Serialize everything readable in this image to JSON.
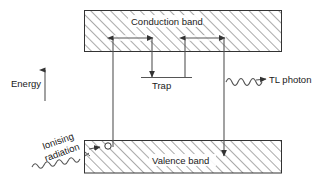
{
  "diagram": {
    "axis": {
      "energy_label": "Energy",
      "energy_arrow_direction": "up"
    },
    "bands": {
      "conduction": {
        "label": "Conduction band",
        "fill": "diagonal-hatch",
        "stroke": "#333333"
      },
      "valence": {
        "label": "Valence band",
        "fill": "diagonal-hatch",
        "stroke": "#333333"
      }
    },
    "levels": {
      "trap": {
        "label": "Trap"
      }
    },
    "excitation": {
      "label": "Ionising\nradiation",
      "label_line_1": "Ionising",
      "label_line_2": "radiation",
      "marker": "hole-circle",
      "squiggle": "wavy-arrow"
    },
    "emission": {
      "label": "TL photon",
      "squiggle": "wavy-arrow"
    },
    "colors": {
      "ink": "#333333",
      "text": "#1a1a1a",
      "hatch": "#555555",
      "background": "#ffffff"
    }
  }
}
